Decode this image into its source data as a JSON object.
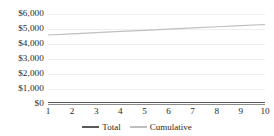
{
  "chart_data": {
    "type": "line",
    "title": "",
    "subtitle": "",
    "xlabel": "",
    "ylabel": "",
    "categories": [
      "1",
      "2",
      "3",
      "4",
      "5",
      "6",
      "7",
      "8",
      "9",
      "10"
    ],
    "x": [
      1,
      2,
      3,
      4,
      5,
      6,
      7,
      8,
      9,
      10
    ],
    "ylim": [
      0,
      6000
    ],
    "ytick_values": [
      6000,
      5000,
      4000,
      3000,
      2000,
      1000,
      0
    ],
    "ytick_labels": [
      "$6,000",
      "$5,000",
      "$4,000",
      "$3,000",
      "$2,000",
      "$1,000",
      "$0"
    ],
    "grid": true,
    "grid_axis": "y",
    "legend_position": "bottom",
    "series": [
      {
        "name": "Total",
        "color": "#595959",
        "values": [
          100,
          100,
          100,
          100,
          100,
          100,
          100,
          100,
          100,
          100
        ]
      },
      {
        "name": "Cumulative",
        "color": "#bfbfbf",
        "values": [
          4600,
          4680,
          4760,
          4840,
          4910,
          4990,
          5070,
          5150,
          5230,
          5300
        ]
      }
    ]
  },
  "axis": {
    "axis_line_color": "#8c8c8c",
    "gridline_color": "#eeeeee"
  },
  "legend": {
    "items": [
      {
        "label": "Total",
        "color": "#595959"
      },
      {
        "label": "Cumulative",
        "color": "#bfbfbf"
      }
    ]
  }
}
